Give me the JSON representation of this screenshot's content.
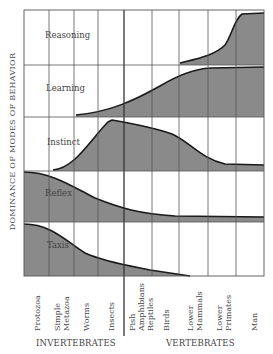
{
  "y_axis_label": "DOMINANCE OF MODES OF BEHAVIOR",
  "rows": [
    {
      "label": "Reasoning"
    },
    {
      "label": "Learning"
    },
    {
      "label": "Instinct"
    },
    {
      "label": "Reflex"
    },
    {
      "label": "Taxis"
    }
  ],
  "columns": [
    {
      "lines": [
        "Protozoa"
      ]
    },
    {
      "lines": [
        "Simple",
        "Metazoa"
      ]
    },
    {
      "lines": [
        "Worms"
      ]
    },
    {
      "lines": [
        "Insects"
      ]
    },
    {
      "lines": [
        "Fish",
        "Amphibians",
        "Reptiles"
      ]
    },
    {
      "lines": [
        "Birds"
      ]
    },
    {
      "lines": [
        "Lower",
        "Mammals"
      ]
    },
    {
      "lines": [
        "Lower",
        "Primates"
      ]
    },
    {
      "lines": [
        "Man"
      ]
    }
  ],
  "groups": {
    "invertebrates": "INVERTEBRATES",
    "vertebrates": "VERTEBRATES"
  },
  "colors": {
    "fill": "#8a8a8a",
    "curve": "#1a1a1a",
    "grid": "#555555"
  }
}
